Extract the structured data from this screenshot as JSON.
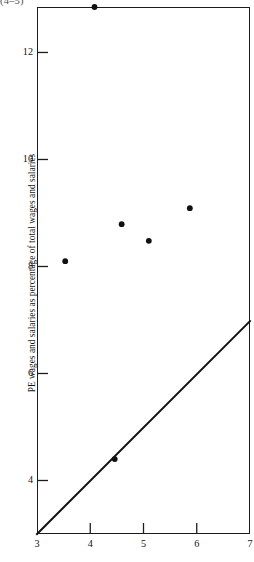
{
  "figure": {
    "corner_note": "(4–5)",
    "background_color": "#ffffff",
    "frame_color": "#1c1c1c",
    "mark_color": "#111111"
  },
  "chart_data": {
    "type": "scatter",
    "title": "",
    "subtitle": "",
    "xlabel": "",
    "ylabel": "PE wages and salaries as percentage of total wages and salaries",
    "xlim": [
      3,
      7
    ],
    "ylim": [
      3,
      12.85
    ],
    "grid": false,
    "legend": null,
    "x_ticks": [
      3,
      4,
      5,
      6,
      7
    ],
    "x_tick_labels": [
      "3",
      "4",
      "5",
      "6",
      "7"
    ],
    "y_ticks": [
      4,
      6,
      8,
      10,
      12
    ],
    "y_tick_labels": [
      "4",
      "6",
      "8",
      "10",
      "12"
    ],
    "points": [
      {
        "x": 3.53,
        "y": 8.1
      },
      {
        "x": 4.08,
        "y": 12.85
      },
      {
        "x": 4.46,
        "y": 4.4
      },
      {
        "x": 4.59,
        "y": 8.79
      },
      {
        "x": 5.1,
        "y": 8.48
      },
      {
        "x": 5.87,
        "y": 9.09
      }
    ],
    "reference_line": {
      "name": "45-degree line",
      "x_start": 3.0,
      "y_start": 3.0,
      "x_end": 7.0,
      "y_end": 6.98
    }
  }
}
